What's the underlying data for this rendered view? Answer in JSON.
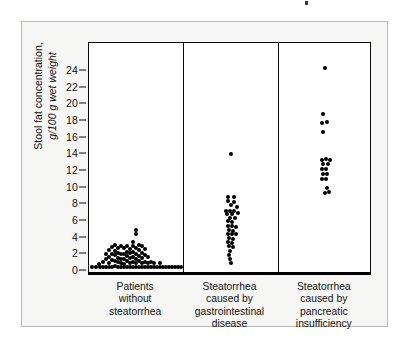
{
  "figure": {
    "background": "#ffffff",
    "panel_background": "#f6f6f5",
    "plot_background": "#ffffff",
    "axis_color": "#0a0a0a",
    "dot_color": "#000000"
  },
  "axis": {
    "y_label_line1": "Stool fat concentration,",
    "y_label_line2": "g/100 g wet weight",
    "y_ticks": [
      0,
      2,
      4,
      6,
      8,
      10,
      12,
      14,
      16,
      18,
      20,
      22,
      24
    ]
  },
  "chart_data": {
    "type": "scatter",
    "title": "",
    "subtitle": "",
    "xlabel": "",
    "ylabel": "Stool fat concentration, g/100 g wet weight",
    "ylim": [
      0,
      25
    ],
    "grid": false,
    "legend": "none",
    "categories": [
      "Patients without steatorrhea",
      "Steatorrhea caused by gastrointestinal disease",
      "Steatorrhea caused by pancreatic insufficiency"
    ],
    "category_label_lines": [
      [
        "Patients",
        "without",
        "steatorrhea"
      ],
      [
        "Steatorrhea",
        "caused by",
        "gastrointestinal",
        "disease"
      ],
      [
        "Steatorrhea",
        "caused by",
        "pancreatic",
        "insufficiency"
      ]
    ],
    "series": [
      {
        "name": "Patients without steatorrhea",
        "n": 92,
        "points": [
          {
            "j": -44,
            "v": 0.5
          },
          {
            "j": -40,
            "v": 0.5
          },
          {
            "j": -36,
            "v": 0.5
          },
          {
            "j": -37,
            "v": 0.9
          },
          {
            "j": -33,
            "v": 0.5
          },
          {
            "j": -33,
            "v": 1.1
          },
          {
            "j": -30,
            "v": 0.5
          },
          {
            "j": -30,
            "v": 1.5
          },
          {
            "j": -30,
            "v": 2.1
          },
          {
            "j": -27,
            "v": 0.5
          },
          {
            "j": -27,
            "v": 1.0
          },
          {
            "j": -27,
            "v": 1.7
          },
          {
            "j": -27,
            "v": 2.5
          },
          {
            "j": -24,
            "v": 0.5
          },
          {
            "j": -24,
            "v": 1.3
          },
          {
            "j": -24,
            "v": 2.0
          },
          {
            "j": -24,
            "v": 2.9
          },
          {
            "j": -21,
            "v": 0.6
          },
          {
            "j": -21,
            "v": 1.2
          },
          {
            "j": -21,
            "v": 1.9
          },
          {
            "j": -21,
            "v": 2.4
          },
          {
            "j": -21,
            "v": 3.1
          },
          {
            "j": -18,
            "v": 0.5
          },
          {
            "j": -18,
            "v": 1.1
          },
          {
            "j": -18,
            "v": 1.6
          },
          {
            "j": -18,
            "v": 2.2
          },
          {
            "j": -18,
            "v": 2.8
          },
          {
            "j": -15,
            "v": 0.5
          },
          {
            "j": -15,
            "v": 1.0
          },
          {
            "j": -15,
            "v": 1.5
          },
          {
            "j": -15,
            "v": 2.0
          },
          {
            "j": -15,
            "v": 3.0
          },
          {
            "j": -12,
            "v": 0.5
          },
          {
            "j": -12,
            "v": 0.9
          },
          {
            "j": -12,
            "v": 1.4
          },
          {
            "j": -12,
            "v": 2.1
          },
          {
            "j": -12,
            "v": 2.8
          },
          {
            "j": -9,
            "v": 0.5
          },
          {
            "j": -9,
            "v": 1.2
          },
          {
            "j": -9,
            "v": 1.8
          },
          {
            "j": -9,
            "v": 2.3
          },
          {
            "j": -9,
            "v": 3.0
          },
          {
            "j": -6,
            "v": 0.5
          },
          {
            "j": -6,
            "v": 1.0
          },
          {
            "j": -6,
            "v": 1.6
          },
          {
            "j": -6,
            "v": 2.2
          },
          {
            "j": -6,
            "v": 2.7
          },
          {
            "j": -3,
            "v": 0.5
          },
          {
            "j": -3,
            "v": 1.1
          },
          {
            "j": -3,
            "v": 1.7
          },
          {
            "j": -3,
            "v": 2.3
          },
          {
            "j": -3,
            "v": 3.0
          },
          {
            "j": -3,
            "v": 3.5
          },
          {
            "j": 0,
            "v": 0.5
          },
          {
            "j": 0,
            "v": 1.0
          },
          {
            "j": 0,
            "v": 1.5
          },
          {
            "j": 0,
            "v": 2.1
          },
          {
            "j": 0,
            "v": 2.8
          },
          {
            "j": 0,
            "v": 4.5
          },
          {
            "j": 0,
            "v": 4.9
          },
          {
            "j": 3,
            "v": 0.5
          },
          {
            "j": 3,
            "v": 1.2
          },
          {
            "j": 3,
            "v": 1.8
          },
          {
            "j": 3,
            "v": 2.5
          },
          {
            "j": 3,
            "v": 3.1
          },
          {
            "j": 6,
            "v": 0.5
          },
          {
            "j": 6,
            "v": 1.0
          },
          {
            "j": 6,
            "v": 1.6
          },
          {
            "j": 6,
            "v": 2.2
          },
          {
            "j": 6,
            "v": 3.0
          },
          {
            "j": 9,
            "v": 0.5
          },
          {
            "j": 9,
            "v": 1.1
          },
          {
            "j": 9,
            "v": 1.9
          },
          {
            "j": 9,
            "v": 2.6
          },
          {
            "j": 12,
            "v": 0.5
          },
          {
            "j": 12,
            "v": 1.0
          },
          {
            "j": 12,
            "v": 1.7
          },
          {
            "j": 15,
            "v": 0.5
          },
          {
            "j": 15,
            "v": 1.1
          },
          {
            "j": 18,
            "v": 0.5
          },
          {
            "j": 18,
            "v": 1.0
          },
          {
            "j": 21,
            "v": 0.5
          },
          {
            "j": 24,
            "v": 0.5
          },
          {
            "j": 24,
            "v": 1.0
          },
          {
            "j": 27,
            "v": 0.5
          },
          {
            "j": 30,
            "v": 0.5
          },
          {
            "j": 33,
            "v": 0.5
          },
          {
            "j": 36,
            "v": 0.5
          },
          {
            "j": 39,
            "v": 0.5
          },
          {
            "j": 42,
            "v": 0.5
          },
          {
            "j": 45,
            "v": 0.5
          }
        ]
      },
      {
        "name": "Steatorrhea caused by gastrointestinal disease",
        "n": 35,
        "points": [
          {
            "j": 0,
            "v": 14.1
          },
          {
            "j": -3,
            "v": 8.9
          },
          {
            "j": 3,
            "v": 8.9
          },
          {
            "j": -3,
            "v": 8.4
          },
          {
            "j": 3,
            "v": 8.3
          },
          {
            "j": 0,
            "v": 7.9
          },
          {
            "j": 6,
            "v": 7.7
          },
          {
            "j": -5,
            "v": 7.2
          },
          {
            "j": -1,
            "v": 7.2
          },
          {
            "j": 3,
            "v": 7.2
          },
          {
            "j": -4,
            "v": 6.9
          },
          {
            "j": 1,
            "v": 6.9
          },
          {
            "j": 7,
            "v": 7.0
          },
          {
            "j": -1,
            "v": 6.4
          },
          {
            "j": 4,
            "v": 6.4
          },
          {
            "j": -3,
            "v": 6.0
          },
          {
            "j": 1,
            "v": 5.9
          },
          {
            "j": -3,
            "v": 5.4
          },
          {
            "j": 1,
            "v": 5.4
          },
          {
            "j": 5,
            "v": 5.3
          },
          {
            "j": -2,
            "v": 4.9
          },
          {
            "j": 2,
            "v": 4.8
          },
          {
            "j": -3,
            "v": 4.5
          },
          {
            "j": 1,
            "v": 4.4
          },
          {
            "j": 5,
            "v": 4.4
          },
          {
            "j": -2,
            "v": 4.0
          },
          {
            "j": 2,
            "v": 3.9
          },
          {
            "j": -3,
            "v": 3.5
          },
          {
            "j": 1,
            "v": 3.4
          },
          {
            "j": -2,
            "v": 3.0
          },
          {
            "j": 2,
            "v": 2.9
          },
          {
            "j": -1,
            "v": 2.4
          },
          {
            "j": -2,
            "v": 1.9
          },
          {
            "j": -1,
            "v": 1.4
          },
          {
            "j": 0,
            "v": 1.0
          }
        ]
      },
      {
        "name": "Steatorrhea caused by pancreatic insufficiency",
        "n": 19,
        "points": [
          {
            "j": 0,
            "v": 24.4
          },
          {
            "j": -2,
            "v": 18.9
          },
          {
            "j": -3,
            "v": 17.8
          },
          {
            "j": 2,
            "v": 17.9
          },
          {
            "j": -2,
            "v": 16.7
          },
          {
            "j": -3,
            "v": 13.3
          },
          {
            "j": 1,
            "v": 13.4
          },
          {
            "j": 5,
            "v": 13.3
          },
          {
            "j": -2,
            "v": 12.8
          },
          {
            "j": 3,
            "v": 12.9
          },
          {
            "j": -3,
            "v": 12.3
          },
          {
            "j": 1,
            "v": 12.2
          },
          {
            "j": -2,
            "v": 11.7
          },
          {
            "j": 2,
            "v": 11.7
          },
          {
            "j": -3,
            "v": 11.0
          },
          {
            "j": 1,
            "v": 11.0
          },
          {
            "j": 2,
            "v": 10.0
          },
          {
            "j": 0,
            "v": 9.4
          },
          {
            "j": 4,
            "v": 9.5
          }
        ]
      }
    ]
  }
}
